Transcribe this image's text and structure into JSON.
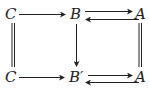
{
  "nodes": {
    "top_left": "C",
    "top_mid": "B",
    "top_right": "A",
    "bot_left": "C",
    "bot_mid": "B′",
    "bot_right": "A"
  },
  "edges": [
    {
      "from": "top_left",
      "to": "top_mid",
      "type": "arrow"
    },
    {
      "from": "top_mid",
      "to": "top_right",
      "type": "arrow"
    },
    {
      "from": "top_right",
      "to": "top_mid",
      "type": "arrow"
    },
    {
      "from": "top_left",
      "to": "bot_left",
      "type": "equality"
    },
    {
      "from": "top_mid",
      "to": "bot_mid",
      "type": "arrow"
    },
    {
      "from": "top_right",
      "to": "bot_right",
      "type": "equality"
    },
    {
      "from": "bot_left",
      "to": "bot_mid",
      "type": "arrow"
    },
    {
      "from": "bot_mid",
      "to": "bot_right",
      "type": "arrow"
    },
    {
      "from": "bot_right",
      "to": "bot_mid",
      "type": "arrow"
    }
  ],
  "colors": {
    "ink": "#222222",
    "background": "#ffffff"
  }
}
